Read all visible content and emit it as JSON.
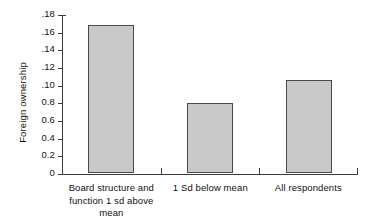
{
  "chart_data": {
    "type": "bar",
    "title": "",
    "subtitle": "",
    "xlabel": "",
    "ylabel": "Foreign ownership",
    "categories": [
      "Board structure and function 1 sd above mean",
      "1 Sd below mean",
      "All respondents"
    ],
    "category_lines": [
      [
        "Board structure and",
        "function 1 sd above",
        "mean"
      ],
      [
        "1 Sd below mean"
      ],
      [
        "All respondents"
      ]
    ],
    "values": [
      0.167,
      0.079,
      0.105
    ],
    "ylim": [
      0,
      0.18
    ],
    "ytick_values": [
      0.18,
      0.16,
      0.14,
      0.12,
      0.1,
      0.08,
      0.06,
      0.04,
      0.02,
      0
    ],
    "ytick_labels": [
      ".18",
      ".16",
      ".14",
      ".12",
      ".10",
      "0.8",
      "0.6",
      "0.4",
      "0.2",
      "0"
    ],
    "grid": false,
    "legend": false,
    "legend_position": "none",
    "bar_fill_color": "#c9c9c9",
    "bar_edge_color": "#4a4a4a",
    "axis_color": "#3b3b3b",
    "background_color": "#ffffff"
  }
}
